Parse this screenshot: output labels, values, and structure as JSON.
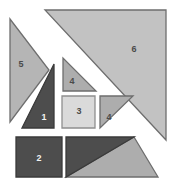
{
  "figure": {
    "name": "tangram-dissection-diagram",
    "background_color": "#ffffff",
    "width": 189,
    "height": 183
  },
  "palette": {
    "light_gray": "#b5b5b5",
    "lighter_gray": "#c2c2c2",
    "pale_gray": "#dadada",
    "medium_gray": "#adadad",
    "dark_gray": "#4d4d4d",
    "outline": "#6e6e6e",
    "dark_outline": "#3a3a3a",
    "label_dark_text": "#4a4a4a",
    "label_light_text": "#f2f2f2"
  },
  "pieces": [
    {
      "id": "piece-5",
      "label": "5",
      "shape": "triangle",
      "fill": "#b5b5b5",
      "stroke": "#6e6e6e",
      "label_color": "light",
      "points": "10,19 10,122 49,70",
      "label_x": 21,
      "label_y": 65
    },
    {
      "id": "piece-1",
      "label": "1",
      "shape": "triangle",
      "fill": "#4d4d4d",
      "stroke": "#3a3a3a",
      "label_color": "dark",
      "points": "54,64 54,128 22,128",
      "label_x": 44,
      "label_y": 118
    },
    {
      "id": "piece-4-upper",
      "label": "4",
      "shape": "triangle",
      "fill": "#adadad",
      "stroke": "#6e6e6e",
      "label_color": "light",
      "points": "63,58 63,91 96,91",
      "label_x": 72,
      "label_y": 82
    },
    {
      "id": "piece-3",
      "label": "3",
      "shape": "square",
      "fill": "#dadada",
      "stroke": "#8f8f8f",
      "label_color": "light",
      "points": "62,96 95,96 95,128 62,128",
      "label_x": 79,
      "label_y": 112
    },
    {
      "id": "piece-4-right",
      "label": "4",
      "shape": "triangle",
      "fill": "#adadad",
      "stroke": "#6e6e6e",
      "label_color": "light",
      "points": "100,96 133,96 100,128",
      "label_x": 109,
      "label_y": 118
    },
    {
      "id": "piece-6",
      "label": "6",
      "shape": "triangle",
      "fill": "#c2c2c2",
      "stroke": "#6e6e6e",
      "label_color": "light",
      "points": "45,10 166,10 166,140",
      "label_x": 134,
      "label_y": 50
    },
    {
      "id": "piece-2",
      "label": "2",
      "shape": "square",
      "fill": "#4d4d4d",
      "stroke": "#3a3a3a",
      "label_color": "dark",
      "points": "16,137 62,137 62,177 16,177",
      "label_x": 39,
      "label_y": 159
    },
    {
      "id": "piece-bottom-dark",
      "label": "",
      "shape": "triangle",
      "fill": "#4d4d4d",
      "stroke": "#3a3a3a",
      "label_color": "dark",
      "points": "66,137 134,137 66,177",
      "label_x": 0,
      "label_y": 0
    },
    {
      "id": "piece-bottom-light",
      "label": "",
      "shape": "triangle",
      "fill": "#adadad",
      "stroke": "#6e6e6e",
      "label_color": "light",
      "points": "134,137 158,177 66,177",
      "label_x": 0,
      "label_y": 0
    }
  ],
  "labels": {
    "one": "1",
    "two": "2",
    "three": "3",
    "four_upper": "4",
    "four_right": "4",
    "five": "5",
    "six": "6"
  }
}
